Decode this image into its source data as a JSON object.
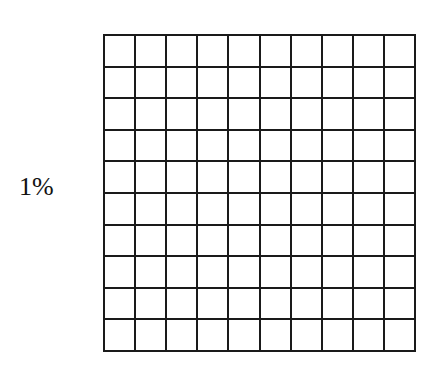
{
  "diagram": {
    "label": "1%",
    "grid": {
      "rows": 10,
      "cols": 10,
      "shaded_cells": 0,
      "line_color": "#1a1a1a",
      "fill_color": "#ffffff"
    }
  }
}
